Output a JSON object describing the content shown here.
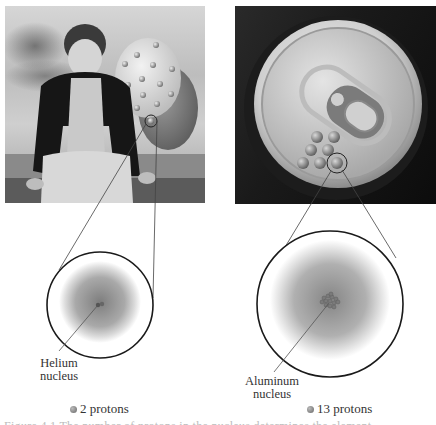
{
  "figure": {
    "left_panel": {
      "photo_subject": "child holding helium balloon",
      "label": "Helium nucleus",
      "label_line1": "Helium",
      "label_line2": "nucleus",
      "legend": "2 protons",
      "proton_count": 2
    },
    "right_panel": {
      "photo_subject": "aluminum can top with pull tab",
      "label": "Aluminum nucleus",
      "label_line1": "Aluminum",
      "label_line2": "nucleus",
      "legend": "13 protons",
      "proton_count": 13
    },
    "caption_partial": "Figure 4.1  The number of protons in the nucleus determines the element"
  },
  "colors": {
    "background": "#ffffff",
    "outline": "#1a1a1a",
    "cloud_center": "#8a8a8a",
    "cloud_edge": "#f2f2f2",
    "text": "#333333"
  }
}
